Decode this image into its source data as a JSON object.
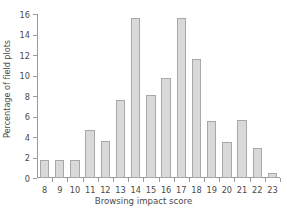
{
  "chart_data": {
    "type": "bar",
    "title": "",
    "xlabel": "Browsing impact score",
    "ylabel": "Percentage of field plots",
    "categories": [
      "8",
      "9",
      "10",
      "11",
      "12",
      "13",
      "14",
      "15",
      "16",
      "17",
      "18",
      "19",
      "20",
      "21",
      "22",
      "23"
    ],
    "values": [
      1.8,
      1.8,
      1.8,
      4.7,
      3.6,
      7.6,
      15.6,
      8.1,
      9.8,
      15.6,
      11.6,
      5.6,
      3.5,
      5.7,
      2.9,
      0.5
    ],
    "ylim": [
      0,
      16
    ],
    "yticks": [
      0,
      2,
      4,
      6,
      8,
      10,
      12,
      14,
      16
    ],
    "ytick_labels": [
      "0",
      "2",
      "4",
      "6",
      "8",
      "10",
      "12",
      "14",
      "16"
    ],
    "xlim": [
      7.5,
      23.5
    ],
    "grid": false,
    "legend": false,
    "bar_fill_color": "#d9d9d9",
    "bar_edge_color": "#a8a8a8",
    "axis_color": "#9a9a9a",
    "text_color": "#4a4a4a",
    "background_color": "#ffffff"
  }
}
